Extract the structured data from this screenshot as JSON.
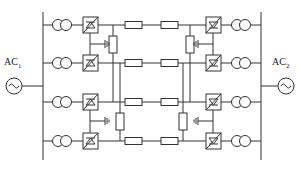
{
  "diagram": {
    "type": "circuit",
    "sources": [
      {
        "id": "ac1",
        "label": "AC",
        "subscript": "1",
        "side": "left"
      },
      {
        "id": "ac2",
        "label": "AC",
        "subscript": "2",
        "side": "right"
      }
    ],
    "rows": [
      25,
      63,
      102,
      141
    ],
    "components": {
      "transformers_per_side": 4,
      "converters_per_side": 4,
      "horizontal_resistors_per_row": 2,
      "vertical_resistors": 4,
      "grounds": 4
    },
    "colors": {
      "line": "#333333",
      "background": "#ffffff"
    }
  }
}
